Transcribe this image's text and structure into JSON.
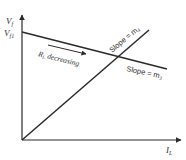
{
  "diagram": {
    "y_axis_label": "V",
    "y_axis_sub": "f",
    "x_axis_label": "I",
    "x_axis_sub": "L",
    "intercept_label": "V",
    "intercept_sub": "f1",
    "arrow_label_main": "R",
    "arrow_label_sub": "L",
    "arrow_label_text": " decreasing",
    "slope_rising_label": "Slope = m",
    "slope_rising_sub": "4",
    "slope_falling_label": "Slope = m",
    "slope_falling_sub": "3",
    "line_color": "#2a2a2a"
  }
}
